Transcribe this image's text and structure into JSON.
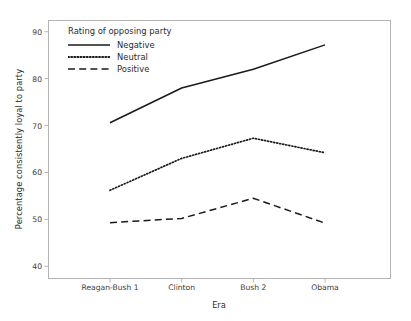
{
  "chart_data": {
    "type": "line",
    "title": "",
    "xlabel": "Era",
    "ylabel": "Percentage consistently loyal to party",
    "categories": [
      "Reagan-Bush 1",
      "Clinton",
      "Bush 2",
      "Obama"
    ],
    "yticks": [
      40,
      50,
      60,
      70,
      80,
      90
    ],
    "ylim": [
      37.5,
      92.5
    ],
    "grid": false,
    "legend": {
      "position": "inside-top-left",
      "title": "Rating of opposing party",
      "entries": [
        {
          "label": "Negative",
          "style": "solid"
        },
        {
          "label": "Neutral",
          "style": "dotted"
        },
        {
          "label": "Positive",
          "style": "dashed"
        }
      ]
    },
    "series": [
      {
        "name": "Negative",
        "style": "solid",
        "color": "#1a1a1a",
        "values": [
          70.6,
          78.0,
          82.0,
          87.2
        ]
      },
      {
        "name": "Neutral",
        "style": "dotted",
        "color": "#1a1a1a",
        "values": [
          56.2,
          63.0,
          67.3,
          64.2
        ]
      },
      {
        "name": "Positive",
        "style": "dashed",
        "color": "#1a1a1a",
        "values": [
          49.3,
          50.2,
          54.5,
          49.2
        ]
      }
    ]
  },
  "axes": {
    "y_title": "Percentage consistently loyal to party",
    "x_title": "Era",
    "y_tick_labels": [
      "90",
      "80",
      "70",
      "60",
      "50",
      "40"
    ],
    "x_tick_labels": [
      "Reagan-Bush 1",
      "Clinton",
      "Bush 2",
      "Obama"
    ]
  },
  "legend": {
    "title": "Rating of opposing party",
    "items": [
      "Negative",
      "Neutral",
      "Positive"
    ]
  },
  "colors": {
    "line": "#1a1a1a",
    "frame": "#b4b4b4",
    "text": "#2b2b2b",
    "background": "#ffffff"
  }
}
